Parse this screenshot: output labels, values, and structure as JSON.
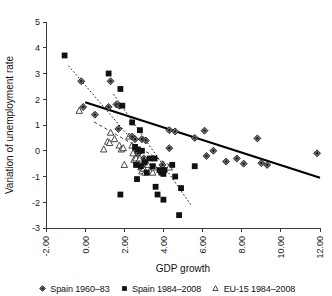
{
  "chart_data": {
    "type": "scatter",
    "title": "",
    "xlabel": "GDP growth",
    "ylabel": "Variation of unemployment rate",
    "xlim": [
      -2.0,
      12.0
    ],
    "ylim": [
      -3,
      5
    ],
    "xticks": [
      "-2.00",
      "0.00",
      "2.00",
      "4.00",
      "6.00",
      "8.00",
      "10.00",
      "12.00"
    ],
    "xtick_values": [
      -2,
      0,
      2,
      4,
      6,
      8,
      10,
      12
    ],
    "yticks": [
      "5",
      "4",
      "3",
      "2",
      "1",
      "0",
      "-1",
      "-2",
      "-3"
    ],
    "ytick_values": [
      5,
      4,
      3,
      2,
      1,
      0,
      -1,
      -2,
      -3
    ],
    "grid": false,
    "legend_position": "bottom",
    "series": [
      {
        "name": "Spain 1960–83",
        "marker": "diamond",
        "points": [
          [
            -0.2,
            2.7
          ],
          [
            -0.1,
            1.7
          ],
          [
            0.5,
            1.4
          ],
          [
            1.2,
            1.7
          ],
          [
            1.3,
            2.7
          ],
          [
            1.6,
            1.8
          ],
          [
            1.75,
            1.75
          ],
          [
            1.7,
            0.85
          ],
          [
            2.4,
            0.55
          ],
          [
            2.55,
            0.45
          ],
          [
            2.9,
            0.45
          ],
          [
            3.1,
            0.4
          ],
          [
            2.6,
            0.05
          ],
          [
            2.7,
            -0.1
          ],
          [
            3.0,
            -0.3
          ],
          [
            4.3,
            0.1
          ],
          [
            4.3,
            0.8
          ],
          [
            4.6,
            0.75
          ],
          [
            5.6,
            0.5
          ],
          [
            6.1,
            0.78
          ],
          [
            6.2,
            -0.2
          ],
          [
            6.55,
            0.0
          ],
          [
            7.2,
            -0.42
          ],
          [
            7.75,
            -0.3
          ],
          [
            8.1,
            -0.5
          ],
          [
            8.8,
            0.48
          ],
          [
            9.0,
            -0.48
          ],
          [
            9.3,
            -0.55
          ],
          [
            11.85,
            -0.1
          ],
          [
            3.95,
            -0.55
          ]
        ]
      },
      {
        "name": "Spain 1984–2008",
        "marker": "square",
        "points": [
          [
            -1.05,
            3.7
          ],
          [
            1.2,
            3.0
          ],
          [
            1.8,
            2.4
          ],
          [
            2.4,
            1.1
          ],
          [
            2.8,
            0.8
          ],
          [
            2.55,
            0.15
          ],
          [
            2.7,
            0.05
          ],
          [
            2.9,
            0.0
          ],
          [
            2.6,
            -0.55
          ],
          [
            2.85,
            -0.6
          ],
          [
            3.05,
            -0.45
          ],
          [
            3.3,
            -0.3
          ],
          [
            3.55,
            -0.3
          ],
          [
            3.8,
            -0.75
          ],
          [
            3.9,
            -0.85
          ],
          [
            4.0,
            -0.9
          ],
          [
            4.05,
            -0.75
          ],
          [
            3.6,
            -1.4
          ],
          [
            2.65,
            -1.1
          ],
          [
            1.8,
            -1.7
          ],
          [
            3.7,
            -1.7
          ],
          [
            4.0,
            -1.9
          ],
          [
            4.45,
            -0.55
          ],
          [
            4.6,
            -1.0
          ],
          [
            4.9,
            -1.45
          ],
          [
            4.8,
            -2.5
          ],
          [
            5.6,
            -0.6
          ],
          [
            1.9,
            1.75
          ],
          [
            3.15,
            -0.85
          ],
          [
            3.45,
            -0.6
          ]
        ]
      },
      {
        "name": "EU-15 1984–2008",
        "marker": "triangle",
        "points": [
          [
            -0.3,
            1.55
          ],
          [
            0.95,
            0.05
          ],
          [
            1.15,
            0.35
          ],
          [
            1.25,
            0.3
          ],
          [
            1.3,
            0.7
          ],
          [
            1.5,
            0.45
          ],
          [
            1.75,
            0.2
          ],
          [
            1.85,
            0.05
          ],
          [
            1.95,
            0.1
          ],
          [
            2.0,
            -0.55
          ],
          [
            2.25,
            0.55
          ],
          [
            2.4,
            0.2
          ],
          [
            2.45,
            -0.1
          ],
          [
            2.5,
            -0.35
          ],
          [
            2.6,
            -0.3
          ],
          [
            2.7,
            -0.45
          ],
          [
            2.75,
            -0.55
          ],
          [
            2.8,
            -0.3
          ],
          [
            2.85,
            -0.65
          ],
          [
            2.9,
            -0.8
          ],
          [
            2.95,
            -0.5
          ],
          [
            3.0,
            -0.7
          ],
          [
            3.05,
            -0.85
          ],
          [
            3.2,
            -0.55
          ],
          [
            3.3,
            -0.8
          ],
          [
            3.45,
            -0.85
          ],
          [
            3.55,
            -0.65
          ],
          [
            3.9,
            -0.8
          ],
          [
            4.0,
            -0.75
          ],
          [
            4.3,
            -0.65
          ]
        ]
      }
    ],
    "trendlines": [
      {
        "name": "Spain 1960–83 trend",
        "style": "dotted",
        "x0": -0.85,
        "y0": 3.3,
        "x1": 2.25,
        "y1": 0.55
      },
      {
        "name": "Spain 1984–2008 trend",
        "style": "solid",
        "x0": 0.0,
        "y0": 1.88,
        "x1": 12.0,
        "y1": -1.05
      },
      {
        "name": "EU-15 1984–2008 trend",
        "style": "dashed",
        "x0": 0.45,
        "y0": 1.12,
        "x1": 4.45,
        "y1": -0.62
      },
      {
        "name": "Spain 1984–2008 steep dotted trend",
        "style": "dotted",
        "x0": 1.45,
        "y0": 2.2,
        "x1": 5.4,
        "y1": -2.1
      }
    ]
  },
  "legend": {
    "items": [
      {
        "label": "Spain 1960–83",
        "marker": "diamond"
      },
      {
        "label": "Spain 1984–2008",
        "marker": "square"
      },
      {
        "label": "EU-15 1984–2008",
        "marker": "triangle"
      }
    ]
  }
}
